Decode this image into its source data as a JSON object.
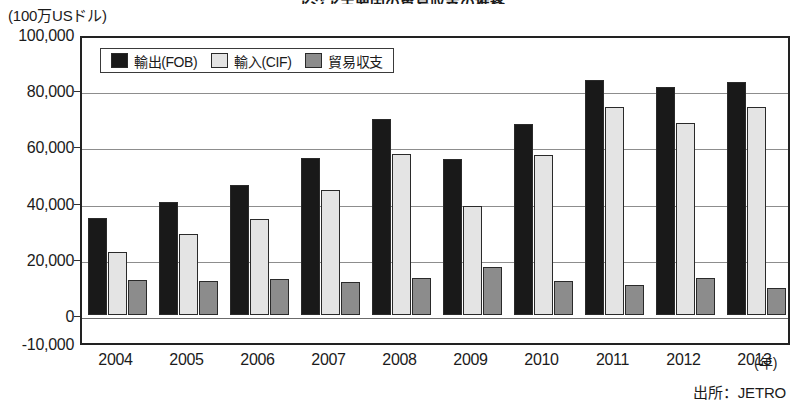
{
  "title": "アジア主要国の貿易収支の推移",
  "unit_label": "(100万USドル)",
  "source_note": "出所：JETRO",
  "xaxis_unit": "(年)",
  "legend": {
    "items": [
      {
        "label": "輸出(FOB)",
        "key": "export",
        "color": "#191919"
      },
      {
        "label": "輸入(CIF)",
        "key": "import",
        "color": "#e4e4e4"
      },
      {
        "label": "貿易収支",
        "key": "balance",
        "color": "#8c8c8c"
      }
    ]
  },
  "yaxis": {
    "ticks": [
      "100,000",
      "80,000",
      "60,000",
      "40,000",
      "20,000",
      "0",
      "-10,000"
    ],
    "tick_values": [
      100000,
      80000,
      60000,
      40000,
      20000,
      0,
      -10000
    ]
  },
  "chart_data": {
    "type": "bar",
    "title": "アジア主要国の貿易収支の推移",
    "xlabel": "(年)",
    "ylabel": "(100万USドル)",
    "ylim": [
      -10000,
      100000
    ],
    "ytick_step": 20000,
    "grid": true,
    "legend_position": "top-left-inside",
    "source": "出所：JETRO",
    "categories": [
      "2004",
      "2005",
      "2006",
      "2007",
      "2008",
      "2009",
      "2010",
      "2011",
      "2012",
      "2013"
    ],
    "series": [
      {
        "name": "輸出(FOB)",
        "color": "#191919",
        "values": [
          34500,
          40100,
          46200,
          55800,
          69800,
          55500,
          68000,
          83800,
          81000,
          83000
        ]
      },
      {
        "name": "輸入(CIF)",
        "color": "#e4e4e4",
        "values": [
          22500,
          28800,
          34200,
          44500,
          57200,
          38800,
          57000,
          74000,
          68500,
          74000
        ]
      },
      {
        "name": "貿易収支",
        "color": "#8c8c8c",
        "values": [
          12500,
          12000,
          12800,
          11700,
          13000,
          17200,
          12000,
          10500,
          13000,
          9600
        ]
      }
    ]
  }
}
